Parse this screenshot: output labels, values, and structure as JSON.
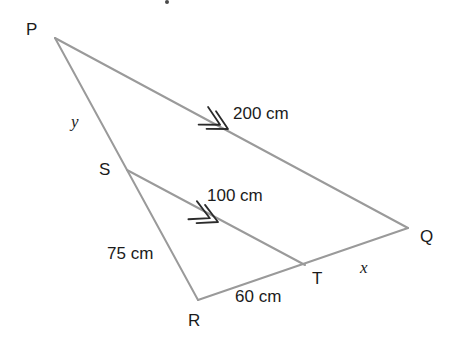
{
  "diagram": {
    "type": "geometry-triangle-similar",
    "background_color": "#ffffff",
    "line_color": "#9a9a9a",
    "line_width": 2,
    "tick_color": "#2b2b2b",
    "text_color": "#1b1b1b",
    "vertices": [
      {
        "id": "P",
        "label": "P",
        "x": 55,
        "y": 38,
        "label_x": 26,
        "label_y": 21
      },
      {
        "id": "Q",
        "label": "Q",
        "x": 408,
        "y": 228,
        "label_x": 420,
        "label_y": 228
      },
      {
        "id": "R",
        "label": "R",
        "x": 198,
        "y": 300,
        "label_x": 188,
        "label_y": 312
      },
      {
        "id": "S",
        "label": "S",
        "x": 127,
        "y": 170,
        "label_x": 99,
        "label_y": 161
      },
      {
        "id": "T",
        "label": "T",
        "x": 305,
        "y": 265,
        "label_x": 312,
        "label_y": 270
      }
    ],
    "segments": [
      {
        "id": "PQ",
        "from": "P",
        "to": "Q"
      },
      {
        "id": "PR",
        "from": "P",
        "to": "R"
      },
      {
        "id": "RQ",
        "from": "R",
        "to": "Q"
      },
      {
        "id": "ST",
        "from": "S",
        "to": "T"
      }
    ],
    "tick_marks": [
      {
        "id": "tick-pq",
        "on_segment": "PQ",
        "x": 228,
        "y": 129,
        "angle_deg": 28.3,
        "chevrons": 2
      },
      {
        "id": "tick-st",
        "on_segment": "ST",
        "x": 218,
        "y": 222,
        "angle_deg": 25.0,
        "chevrons": 2
      }
    ],
    "measure_labels": [
      {
        "id": "label-200",
        "text": "200 cm",
        "x": 233,
        "y": 105,
        "segment": "PQ",
        "style": "upright"
      },
      {
        "id": "label-100",
        "text": "100 cm",
        "x": 207,
        "y": 187,
        "segment": "ST",
        "style": "upright"
      },
      {
        "id": "label-75",
        "text": "75 cm",
        "x": 107,
        "y": 245,
        "segment": "SR",
        "style": "upright"
      },
      {
        "id": "label-60",
        "text": "60 cm",
        "x": 235,
        "y": 288,
        "segment": "RT",
        "style": "upright"
      },
      {
        "id": "label-x",
        "text": "x",
        "x": 360,
        "y": 259,
        "segment": "TQ",
        "style": "italic"
      },
      {
        "id": "label-y",
        "text": "y",
        "x": 71,
        "y": 113,
        "segment": "PS",
        "style": "italic"
      }
    ],
    "artifact": {
      "id": "top-speck",
      "x": 165,
      "y": 0,
      "size": 4
    }
  }
}
